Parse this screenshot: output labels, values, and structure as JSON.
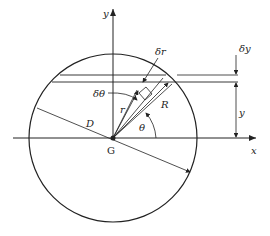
{
  "figure": {
    "labels": {
      "y_axis": "y",
      "x_axis": "x",
      "center": "G",
      "diameter": "D",
      "radius_outer": "R",
      "radius_var": "r",
      "delta_r": "δr",
      "delta_theta": "δθ",
      "theta": "θ",
      "delta_y": "δy",
      "y_dim": "y"
    },
    "colors": {
      "ink": "#222222",
      "background": "#ffffff"
    }
  }
}
